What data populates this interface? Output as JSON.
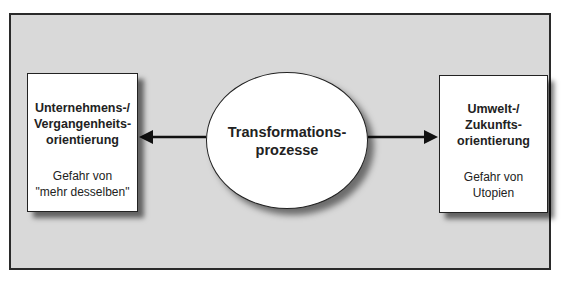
{
  "diagram": {
    "left_box": {
      "title_lines": [
        "Unternehmens-/",
        "Vergangenheits-",
        "orientierung"
      ],
      "subtitle_lines": [
        "Gefahr von",
        "\"mehr desselben\""
      ]
    },
    "center": {
      "title_lines": [
        "Transformations-",
        "prozesse"
      ]
    },
    "right_box": {
      "title_lines": [
        "Umwelt-/",
        "Zukunfts-",
        "orientierung"
      ],
      "subtitle_lines": [
        "Gefahr von",
        "Utopien"
      ]
    },
    "connections": [
      {
        "from": "center",
        "to": "left_box",
        "type": "arrow"
      },
      {
        "from": "center",
        "to": "right_box",
        "type": "arrow"
      }
    ],
    "colors": {
      "panel_background": "#d9d9d9",
      "shape_fill": "#ffffff",
      "stroke": "#222222"
    }
  }
}
